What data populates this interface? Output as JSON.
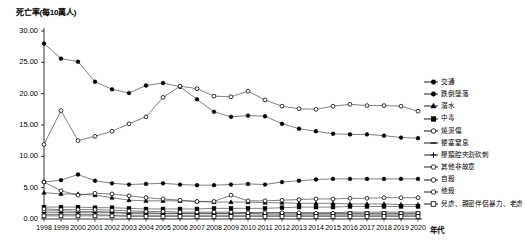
{
  "chart_data": {
    "type": "line",
    "title": "",
    "ylabel": "死亡率(每10萬人)",
    "xlabel": "年代",
    "ylim": [
      0,
      30
    ],
    "ytick_labels": [
      "0.00",
      "5.00",
      "10.00",
      "15.00",
      "20.00",
      "25.00",
      "30.00"
    ],
    "ytick_values": [
      0,
      5,
      10,
      15,
      20,
      25,
      30
    ],
    "grid": false,
    "legend_position": "right",
    "categories": [
      "1998",
      "1999",
      "2000",
      "2001",
      "2002",
      "2003",
      "2004",
      "2005",
      "2006",
      "2007",
      "2008",
      "2009",
      "2010",
      "2011",
      "2012",
      "2013",
      "2014",
      "2015",
      "2016",
      "2017",
      "2018",
      "2019",
      "2020"
    ],
    "x": [
      1998,
      1999,
      2000,
      2001,
      2002,
      2003,
      2004,
      2005,
      2006,
      2007,
      2008,
      2009,
      2010,
      2011,
      2012,
      2013,
      2014,
      2015,
      2016,
      2017,
      2018,
      2019,
      2020
    ],
    "series": [
      {
        "name": "交通",
        "marker": "filled-circle",
        "values": [
          28.0,
          25.6,
          25.1,
          21.9,
          20.7,
          20.1,
          21.3,
          21.7,
          21.1,
          19.1,
          17.1,
          16.3,
          16.5,
          16.4,
          15.2,
          14.4,
          14.0,
          13.6,
          13.5,
          13.5,
          13.3,
          13.0,
          12.9
        ]
      },
      {
        "name": "跌倒墜落",
        "marker": "filled-circle",
        "values": [
          5.9,
          6.2,
          7.1,
          6.1,
          5.7,
          5.5,
          5.6,
          5.7,
          5.5,
          5.4,
          5.4,
          5.5,
          5.6,
          5.5,
          5.9,
          6.1,
          6.3,
          6.4,
          6.4,
          6.4,
          6.4,
          6.4,
          6.4
        ]
      },
      {
        "name": "溺水",
        "marker": "filled-triangle",
        "values": [
          4.2,
          4.0,
          4.0,
          3.8,
          3.4,
          3.0,
          2.9,
          2.9,
          2.9,
          2.8,
          2.7,
          2.7,
          2.7,
          2.6,
          2.6,
          2.5,
          2.5,
          2.5,
          2.4,
          2.4,
          2.4,
          2.3,
          2.3
        ]
      },
      {
        "name": "中毒",
        "marker": "filled-square",
        "values": [
          1.9,
          1.9,
          1.9,
          1.8,
          1.8,
          1.7,
          1.6,
          1.6,
          1.6,
          1.6,
          1.7,
          1.7,
          1.7,
          1.7,
          1.8,
          1.9,
          1.9,
          1.9,
          2.0,
          2.0,
          2.0,
          2.0,
          2.0
        ]
      },
      {
        "name": "燒燙傷",
        "marker": "open-circle",
        "values": [
          1.3,
          1.3,
          1.2,
          1.2,
          1.1,
          1.0,
          1.0,
          0.9,
          0.9,
          0.9,
          0.9,
          0.9,
          0.9,
          0.8,
          0.8,
          0.8,
          0.8,
          0.8,
          0.8,
          0.8,
          0.8,
          0.8,
          0.8
        ]
      },
      {
        "name": "梗塞窒息",
        "marker": "dash",
        "values": [
          1.0,
          1.0,
          1.0,
          1.0,
          1.0,
          0.9,
          0.9,
          0.9,
          0.9,
          0.9,
          0.9,
          0.9,
          1.0,
          1.0,
          1.0,
          1.0,
          1.0,
          1.0,
          1.1,
          1.1,
          1.1,
          1.1,
          1.1
        ]
      },
      {
        "name": "壓頸腔夾割砍刺",
        "marker": "plus",
        "values": [
          0.7,
          0.7,
          0.7,
          0.7,
          0.6,
          0.6,
          0.6,
          0.6,
          0.6,
          0.6,
          0.6,
          0.6,
          0.6,
          0.6,
          0.6,
          0.6,
          0.6,
          0.6,
          0.6,
          0.6,
          0.6,
          0.6,
          0.6
        ]
      },
      {
        "name": "其他非故意",
        "marker": "open-circle",
        "values": [
          11.9,
          17.3,
          12.5,
          13.2,
          14.0,
          15.2,
          16.3,
          19.4,
          21.2,
          20.8,
          19.6,
          19.5,
          20.4,
          19.0,
          18.0,
          17.6,
          17.5,
          18.0,
          18.3,
          18.1,
          18.1,
          18.0,
          17.2
        ]
      },
      {
        "name": "自殺",
        "marker": "open-circle",
        "values": [
          5.9,
          4.5,
          3.8,
          4.1,
          4.0,
          3.7,
          3.4,
          3.2,
          3.0,
          2.8,
          2.8,
          3.8,
          2.9,
          2.9,
          3.0,
          3.1,
          3.2,
          3.2,
          3.3,
          3.3,
          3.4,
          3.4,
          3.4
        ]
      },
      {
        "name": "他殺",
        "marker": "open-circle",
        "values": [
          1.6,
          1.5,
          1.5,
          1.5,
          1.4,
          1.3,
          1.2,
          1.2,
          1.1,
          1.1,
          1.1,
          1.1,
          1.0,
          1.0,
          1.0,
          1.0,
          0.9,
          0.9,
          0.9,
          0.9,
          0.9,
          0.9,
          0.9
        ]
      },
      {
        "name": "兒虐、親密伴侶暴力、老虐",
        "marker": "open-square",
        "values": [
          0.5,
          0.5,
          0.5,
          0.5,
          0.5,
          0.4,
          0.4,
          0.4,
          0.4,
          0.4,
          0.4,
          0.4,
          0.4,
          0.4,
          0.4,
          0.4,
          0.4,
          0.4,
          0.4,
          0.4,
          0.4,
          0.4,
          0.4
        ]
      }
    ]
  },
  "legend": {
    "items": [
      {
        "label": "交通",
        "marker": "filled-circle"
      },
      {
        "label": "跌倒墜落",
        "marker": "filled-circle"
      },
      {
        "label": "溺水",
        "marker": "filled-triangle"
      },
      {
        "label": "中毒",
        "marker": "filled-square"
      },
      {
        "label": "燒燙傷",
        "marker": "open-circle"
      },
      {
        "label": "梗塞窒息",
        "marker": "dash"
      },
      {
        "label": "壓頸腔夾割砍刺",
        "marker": "plus"
      },
      {
        "label": "其他非故意",
        "marker": "open-circle"
      },
      {
        "label": "自殺",
        "marker": "open-circle"
      },
      {
        "label": "他殺",
        "marker": "open-circle"
      },
      {
        "label": "兒虐、親密伴侶暴力、老虐",
        "marker": "open-square"
      }
    ]
  }
}
